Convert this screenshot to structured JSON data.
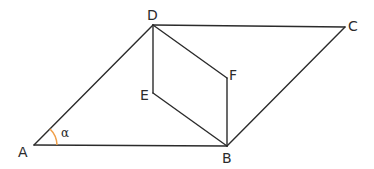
{
  "diagram": {
    "type": "geometry",
    "points": {
      "A": {
        "label": "A",
        "x": 34,
        "y": 145
      },
      "B": {
        "label": "B",
        "x": 227,
        "y": 146
      },
      "C": {
        "label": "C",
        "x": 345,
        "y": 27
      },
      "D": {
        "label": "D",
        "x": 153,
        "y": 25
      },
      "E": {
        "label": "E",
        "x": 153,
        "y": 93
      },
      "F": {
        "label": "F",
        "x": 227,
        "y": 78
      }
    },
    "segments": [
      "AB",
      "AD",
      "DC",
      "CB",
      "DE",
      "DF",
      "EB",
      "FB"
    ],
    "angle": {
      "label": "α",
      "vertex": "A",
      "color": "#f0a04b"
    },
    "line_color": "#2b2b2b"
  }
}
